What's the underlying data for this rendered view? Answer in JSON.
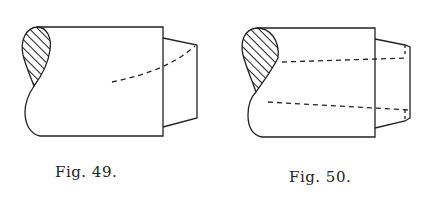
{
  "figures": [
    {
      "id": "fig49",
      "caption": "Fig. 49.",
      "description": "Shaft end with tapered spigot, curved dashed line"
    },
    {
      "id": "fig50",
      "caption": "Fig. 50.",
      "description": "Shaft end with tapered spigot, two dashed parallel lines"
    }
  ],
  "colors": {
    "line": "#222222",
    "background": "#ffffff"
  }
}
